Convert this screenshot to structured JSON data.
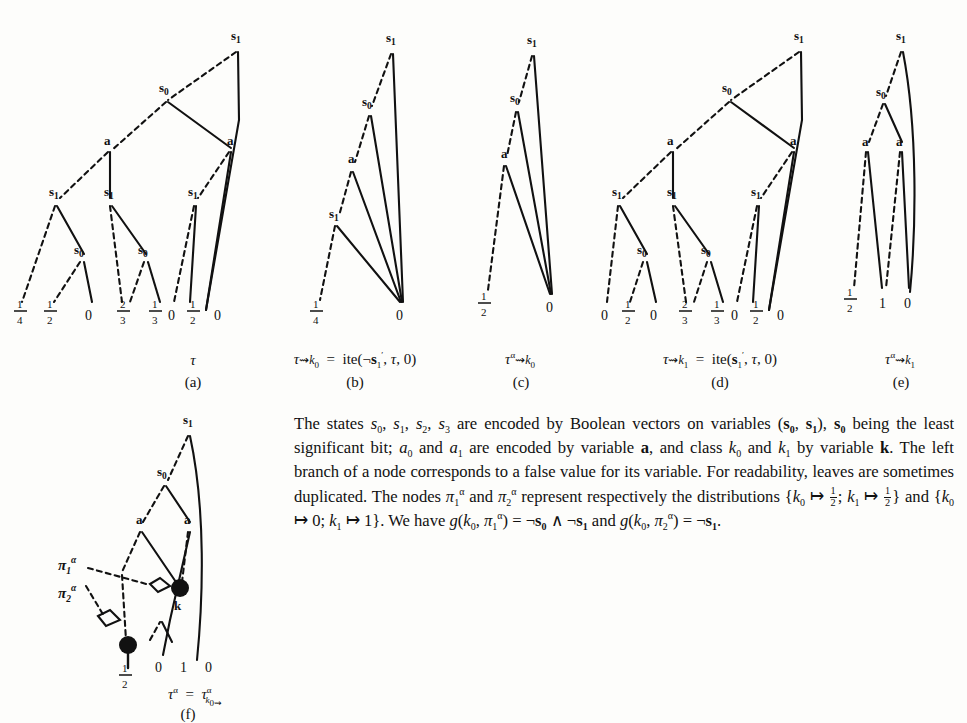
{
  "figure": {
    "kind": "decision-tree-diagram",
    "panels": [
      {
        "id": "a",
        "caption": "τ",
        "label": "(a)",
        "nodes": [
          "s1",
          "s0",
          "a",
          "a",
          "s1",
          "s1",
          "s1",
          "s0",
          "s0"
        ],
        "leaves": [
          "1/4",
          "1/2",
          "0",
          "2/3",
          "1/3",
          "0",
          "1/2",
          "0"
        ]
      },
      {
        "id": "b",
        "caption": "τ⤳k0 = ite(¬s'1, τ, 0)",
        "label": "(b)",
        "nodes": [
          "s1",
          "s0",
          "a",
          "s1"
        ],
        "leaves": [
          "1/4",
          "0"
        ]
      },
      {
        "id": "c",
        "caption": "τα⤳k0",
        "label": "(c)",
        "nodes": [
          "s1",
          "s0",
          "a"
        ],
        "leaves": [
          "1/2",
          "0"
        ]
      },
      {
        "id": "d",
        "caption": "τ⤳k1 = ite(s'1, τ, 0)",
        "label": "(d)",
        "nodes": [
          "s1",
          "s0",
          "a",
          "a",
          "s1",
          "s1",
          "s1",
          "s0",
          "s0"
        ],
        "leaves": [
          "0",
          "1/2",
          "0",
          "2/3",
          "1/3",
          "0",
          "1/2",
          "0"
        ]
      },
      {
        "id": "e",
        "caption": "τα⤳k1",
        "label": "(e)",
        "nodes": [
          "s1",
          "s0",
          "a",
          "a"
        ],
        "leaves": [
          "1/2",
          "1",
          "0"
        ]
      },
      {
        "id": "f",
        "caption": "τα = τα k0⤳",
        "label": "(f)",
        "nodes": [
          "s1",
          "s0",
          "a",
          "a",
          "k"
        ],
        "leaves": [
          "1/2",
          "0",
          "1",
          "0"
        ],
        "pi_labels": [
          "πα₁",
          "πα₂"
        ]
      }
    ],
    "node_labels": {
      "s0": "s",
      "s0_sub": "0",
      "s1": "s",
      "s1_sub": "1",
      "a": "a",
      "k": "k"
    },
    "leaf_values": {
      "zero": "0",
      "one": "1",
      "quarter_n": "1",
      "quarter_d": "4",
      "half_n": "1",
      "half_d": "2",
      "twothirds_n": "2",
      "twothirds_d": "3",
      "third_n": "1",
      "third_d": "3"
    }
  },
  "captions": {
    "a_expr_tau": "τ",
    "a_id": "(a)",
    "b_id": "(b)",
    "c_id": "(c)",
    "d_id": "(d)",
    "e_id": "(e)",
    "f_id": "(f)"
  },
  "body_text": {
    "line1_a": "The states ",
    "line1_vars": "s",
    "paragraph_plain": "The states s0, s1, s2, s3 are encoded by Boolean vectors on variables (s0, s1), s0 being the least significant bit; a0 and a1 are encoded by variable a, and class k0 and k1 by variable k. The left branch of a node corresponds to a false value for its variable. For readability, leaves are sometimes duplicated. The nodes π1α and π2α represent respectively the distributions {k0 ↦ 1/2; k1 ↦ 1/2} and {k0 ↦ 0; k1 ↦ 1}. We have g(k0, π1α) = ¬s0 ∧ ¬s1 and g(k0, π2α) = ¬s1."
  },
  "colors": {
    "ink": "#111111",
    "page": "#fdfdfb"
  }
}
